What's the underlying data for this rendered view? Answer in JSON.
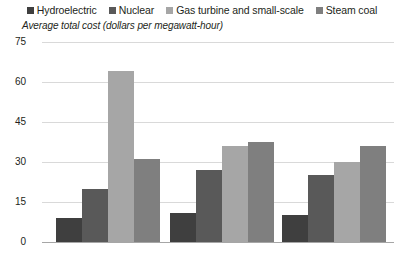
{
  "chart_data": {
    "type": "bar",
    "title": "",
    "subtitle": "",
    "ylabel": "Average total cost (dollars per megawatt-hour)",
    "xlabel": "",
    "categories": [
      "2007",
      "2012",
      "2017"
    ],
    "series": [
      {
        "name": "Hydroelectric",
        "color": "#3f3f3f",
        "values": [
          9,
          11,
          10
        ]
      },
      {
        "name": "Nuclear",
        "color": "#595959",
        "values": [
          20,
          27,
          25
        ]
      },
      {
        "name": "Gas turbine and small-scale",
        "color": "#a6a6a6",
        "values": [
          64,
          36,
          30
        ]
      },
      {
        "name": "Steam coal",
        "color": "#7f7f7f",
        "values": [
          31,
          37.5,
          36
        ]
      }
    ],
    "ylim": [
      0,
      75
    ],
    "yticks": [
      0,
      15,
      30,
      45,
      60,
      75
    ],
    "ytick_labels": [
      "0",
      "15",
      "30",
      "45",
      "60",
      "75"
    ],
    "grid": true,
    "legend_position": "top"
  },
  "legend": {
    "items": [
      {
        "label": "Hydroelectric",
        "swatch": "#3f3f3f"
      },
      {
        "label": "Nuclear",
        "swatch": "#595959"
      },
      {
        "label": "Gas turbine and small-scale",
        "swatch": "#a6a6a6"
      },
      {
        "label": "Steam coal",
        "swatch": "#7f7f7f"
      }
    ]
  },
  "colors": {
    "gridline": "#d9d9d9",
    "baseline": "#a6a6a6",
    "text": "#231f20",
    "background": "#ffffff"
  }
}
